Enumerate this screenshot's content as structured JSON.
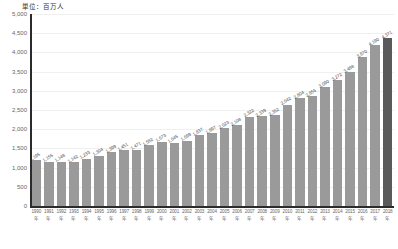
{
  "caption": "単位：百万人",
  "colors": {
    "bar": "#9a9a9a",
    "bar_highlight": "#5a5a5a",
    "axis": "#2b2b2b",
    "grid": "#f0f0f0",
    "text": "#666666"
  },
  "year_suffix": "年",
  "chart_data": {
    "type": "bar",
    "title": "単位：百万人",
    "xlabel": "",
    "ylabel": "",
    "ylim": [
      0,
      5000
    ],
    "ytick_labels": [
      "5,000",
      "4,500",
      "4,000",
      "3,500",
      "3,000",
      "2,500",
      "2,000",
      "1,500",
      "1,000",
      "500",
      "0"
    ],
    "yticks": [
      5000,
      4500,
      4000,
      3500,
      3000,
      2500,
      2000,
      1500,
      1000,
      500,
      0
    ],
    "grid": true,
    "legend": "none",
    "categories": [
      "1990",
      "1991",
      "1992",
      "1993",
      "1994",
      "1995",
      "1996",
      "1997",
      "1998",
      "1999",
      "2000",
      "2001",
      "2002",
      "2003",
      "2004",
      "2005",
      "2006",
      "2007",
      "2008",
      "2009",
      "2010",
      "2011",
      "2012",
      "2013",
      "2014",
      "2015",
      "2016",
      "2017",
      "2018"
    ],
    "values": [
      1195,
      1155,
      1148,
      1142,
      1233,
      1304,
      1399,
      1451,
      1471,
      1582,
      1673,
      1645,
      1699,
      1837,
      1897,
      2023,
      2108,
      2322,
      2339,
      2362,
      2642,
      2804,
      2856,
      3090,
      3272,
      3488,
      3870,
      4190,
      4371
    ],
    "value_labels": [
      "1,195",
      "1,155",
      "1,148",
      "1,142",
      "1,233",
      "1,304",
      "1,399",
      "1,451",
      "1,471",
      "1,582",
      "1,673",
      "1,645",
      "1,699",
      "1,837",
      "1,897",
      "2,023",
      "2,108",
      "2,322",
      "2,339",
      "2,362",
      "2,642",
      "2,804",
      "2,856",
      "3,090",
      "3,272",
      "3,488",
      "3,870",
      "4,190",
      "4,371"
    ],
    "highlight_index": 28
  }
}
